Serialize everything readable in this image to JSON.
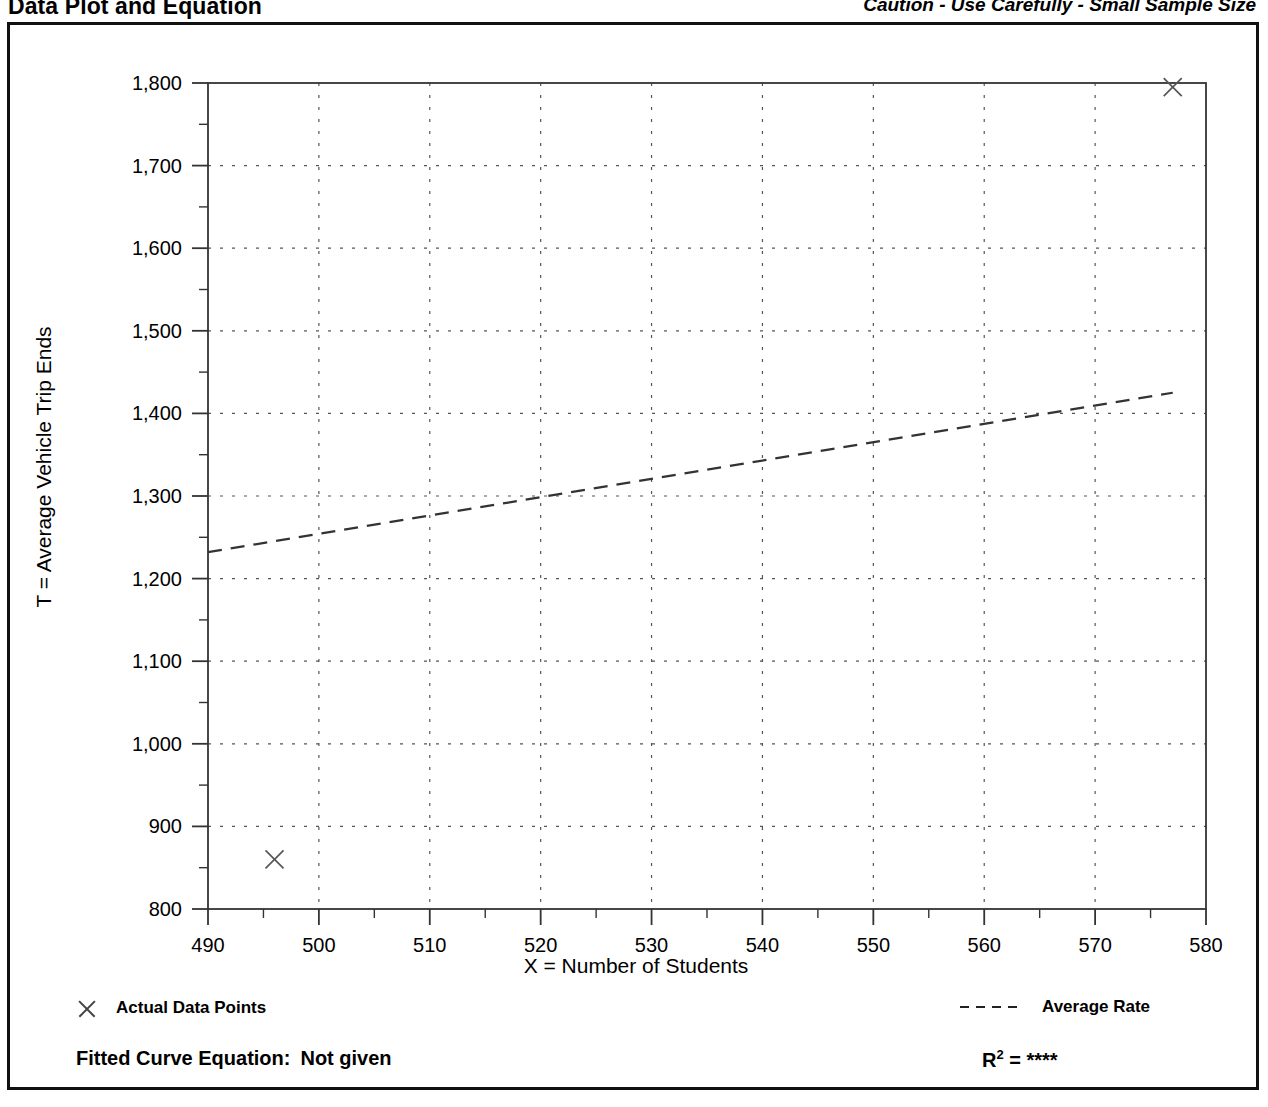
{
  "header": {
    "title": "Data Plot and Equation",
    "caution": "Caution - Use Carefully - Small Sample Size"
  },
  "legend": {
    "points_label": "Actual Data Points",
    "rate_label": "Average Rate",
    "points_marker": "x-marker-icon",
    "rate_marker": "dashed-line-icon"
  },
  "footer": {
    "fitted_label": "Fitted Curve Equation:",
    "fitted_value": "Not given",
    "r_label": "R",
    "r_exponent": "2",
    "r_equals": "=",
    "r_value": "****"
  },
  "chart_data": {
    "type": "scatter",
    "title": "Data Plot and Equation",
    "subtitle": "Caution - Use Carefully - Small Sample Size",
    "xlabel": "X = Number of Students",
    "ylabel": "T = Average Vehicle Trip Ends",
    "xlim": [
      490,
      580
    ],
    "ylim": [
      800,
      1800
    ],
    "xticks": [
      490,
      500,
      510,
      520,
      530,
      540,
      550,
      560,
      570,
      580
    ],
    "yticks": [
      800,
      900,
      1000,
      1100,
      1200,
      1300,
      1400,
      1500,
      1600,
      1700,
      1800
    ],
    "xtick_labels": [
      "490",
      "500",
      "510",
      "520",
      "530",
      "540",
      "550",
      "560",
      "570",
      "580"
    ],
    "ytick_labels": [
      "800",
      "900",
      "1,000",
      "1,100",
      "1,200",
      "1,300",
      "1,400",
      "1,500",
      "1,600",
      "1,700",
      "1,800"
    ],
    "minor_tick_step_x": 5,
    "minor_tick_step_y": 50,
    "grid": true,
    "grid_style": "dotted",
    "legend_position": "below-plot",
    "series": [
      {
        "name": "Actual Data Points",
        "type": "scatter",
        "marker": "x",
        "points": [
          {
            "x": 496,
            "y": 860
          },
          {
            "x": 577,
            "y": 1795
          }
        ]
      },
      {
        "name": "Average Rate",
        "type": "line",
        "style": "dashed",
        "points": [
          {
            "x": 490,
            "y": 1232
          },
          {
            "x": 577,
            "y": 1425
          }
        ]
      }
    ]
  }
}
